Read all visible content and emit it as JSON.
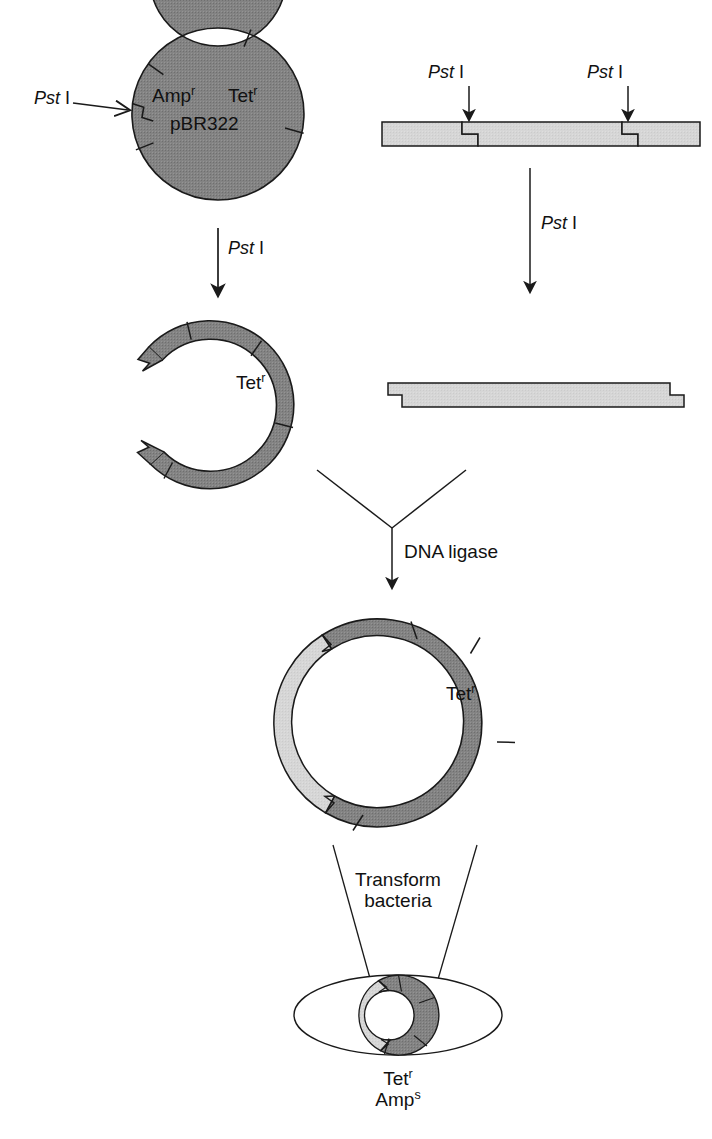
{
  "figure": {
    "colors": {
      "plasmid_dark_gray": "#808080",
      "insert_light_gray": "#d4d4d4",
      "outline_black": "#1a1a1a",
      "background_white": "#ffffff"
    }
  },
  "step1_vector": {
    "plasmid_name": "pBR322",
    "marker_amp": "Amp",
    "marker_amp_sup": "r",
    "marker_tet": "Tet",
    "marker_tet_sup": "r",
    "cut_site_label_italic": "Pst",
    "cut_site_label_roman": " I",
    "arrow_label_italic": "Pst",
    "arrow_label_roman": " I"
  },
  "step1_insert_dna": {
    "cut_site_left_italic": "Pst",
    "cut_site_left_roman": " I",
    "cut_site_right_italic": "Pst",
    "cut_site_right_roman": " I",
    "arrow_label_italic": "Pst",
    "arrow_label_roman": " I"
  },
  "step2_cut_vector": {
    "marker_tet": "Tet",
    "marker_tet_sup": "r"
  },
  "step2_cut_fragment": {
    "description": "excised DNA fragment with sticky ends"
  },
  "step3_ligation": {
    "enzyme_label": "DNA ligase"
  },
  "step4_recombinant": {
    "marker_tet": "Tet",
    "marker_tet_sup": "r"
  },
  "step5_transformation": {
    "action_line1": "Transform",
    "action_line2": "bacteria",
    "result_line1_base": "Tet",
    "result_line1_sup": "r",
    "result_line2_base": "Amp",
    "result_line2_sup": "s"
  }
}
